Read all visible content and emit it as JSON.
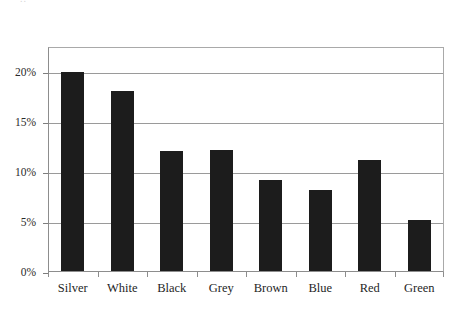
{
  "artifact": {
    "top_cropped_text": ".."
  },
  "chart_data": {
    "type": "bar",
    "title": "",
    "subtitle": "",
    "xlabel": "",
    "ylabel": "",
    "categories": [
      "Silver",
      "White",
      "Black",
      "Grey",
      "Brown",
      "Blue",
      "Red",
      "Green"
    ],
    "values": [
      20.0,
      18.1,
      12.1,
      12.2,
      9.2,
      8.2,
      11.2,
      5.2
    ],
    "value_labels": [
      "20%",
      "18%",
      "12%",
      "12%",
      "9%",
      "8%",
      "11%",
      "5%"
    ],
    "series": [
      {
        "name": "Share",
        "values": [
          20.0,
          18.1,
          12.1,
          12.2,
          9.2,
          8.2,
          11.2,
          5.2
        ]
      }
    ],
    "ylim": [
      0,
      22.5
    ],
    "ytick_values": [
      0,
      5,
      10,
      15,
      20
    ],
    "ytick_labels": [
      "0%",
      "5%",
      "10%",
      "15%",
      "20%"
    ],
    "grid": true,
    "grid_axis": "y",
    "legend": false,
    "legend_position": "none",
    "bar_color": "#1c1c1c",
    "gridline_color": "#9a9a9a",
    "axis_color": "#8d8d8d",
    "background_color": "#ffffff",
    "annotations": []
  }
}
